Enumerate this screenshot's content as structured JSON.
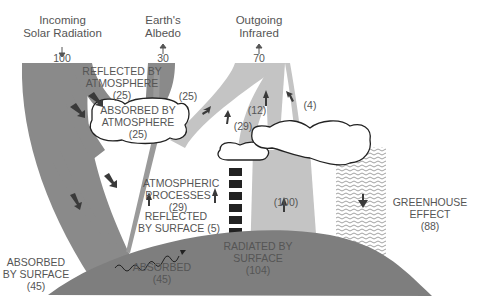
{
  "headers": {
    "incoming": {
      "line1": "Incoming",
      "line2": "Solar Radiation",
      "value": "100"
    },
    "albedo": {
      "line1": "Earth's",
      "line2": "Albedo",
      "value": "30"
    },
    "outgoing": {
      "line1": "Outgoing",
      "line2": "Infrared",
      "value": "70"
    }
  },
  "labels": {
    "reflected_atm": {
      "line1": "REFLECTED BY",
      "line2": "ATMOSPHERE",
      "value": "(25)"
    },
    "absorbed_atm": {
      "line1": "ABSORBED BY",
      "line2": "ATMOSPHERE",
      "value": "(25)"
    },
    "atm_processes": {
      "line1": "ATMOSPHERIC",
      "line2": "PROCESSES",
      "value": "(29)"
    },
    "reflected_surface": {
      "line1": "REFLECTED",
      "line2": "BY SURFACE (5)"
    },
    "absorbed_surface": {
      "line1": "ABSORBED",
      "line2": "BY SURFACE",
      "value": "(45)"
    },
    "absorbed": {
      "line1": "ABSORBED",
      "value": "(45)"
    },
    "radiated_surface": {
      "line1": "RADIATED BY",
      "line2": "SURFACE",
      "value": "(104)"
    },
    "greenhouse": {
      "line1": "GREENHOUSE",
      "line2": "EFFECT",
      "value": "(88)"
    },
    "flow_25": "(25)",
    "flow_29": "(29)",
    "flow_12": "(12)",
    "flow_4": "(4)",
    "flow_100": "(100)"
  },
  "colors": {
    "dark_flow": "#8a8a8a",
    "light_flow": "#c4c4c4",
    "ground": "#7e7e7e",
    "arrow": "#3a3a3a",
    "text": "#555555"
  }
}
